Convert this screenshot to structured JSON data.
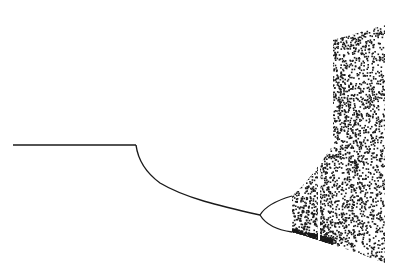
{
  "figure": {
    "title": "",
    "background": "#ffffff",
    "ink": "#1a1a1a"
  },
  "chart_data": {
    "type": "scatter",
    "title": "",
    "xlabel": "",
    "ylabel": "",
    "segments": [
      {
        "name": "fixed-zero",
        "from_px": [
          13,
          145
        ],
        "to_px": [
          136,
          145
        ]
      },
      {
        "name": "stable-branch",
        "from_px": [
          136,
          145
        ],
        "to_px": [
          260,
          215
        ]
      },
      {
        "name": "period-2",
        "split_px": [
          260,
          215
        ],
        "upper_end_px": [
          292,
          195
        ],
        "lower_end_px": [
          292,
          232
        ]
      },
      {
        "name": "chaos",
        "x_range_px": [
          292,
          385
        ],
        "top_px_at_333": 40,
        "top_px_at_385": 25,
        "bottom_px_at_385": 262,
        "left_edge_px": 333
      }
    ],
    "grid": false,
    "legend": null
  }
}
